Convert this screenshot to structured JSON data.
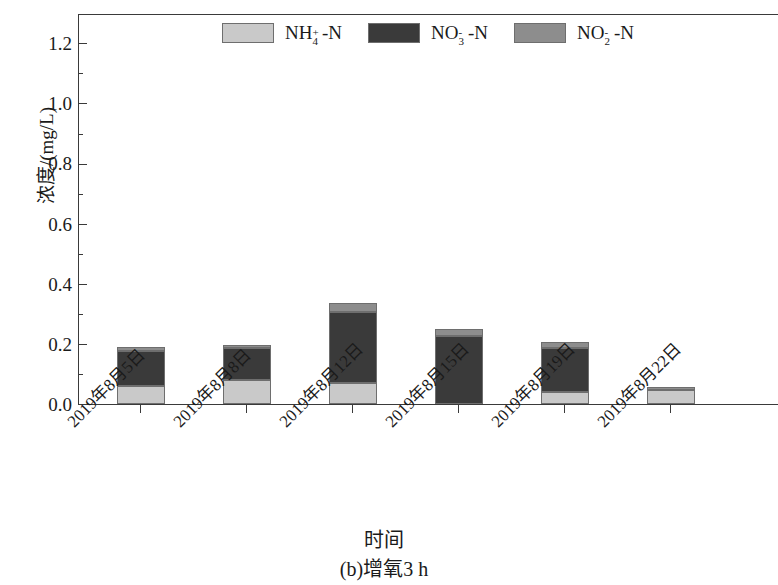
{
  "chart_data": {
    "type": "bar",
    "subtype": "stacked",
    "title": "",
    "caption": "(b)增氧3 h",
    "xlabel": "时间",
    "ylabel": "浓度/(mg/L)",
    "ylim": [
      0.0,
      1.3
    ],
    "ytick_labels": [
      "0.0",
      "0.2",
      "0.4",
      "0.6",
      "0.8",
      "1.0",
      "1.2"
    ],
    "ytick_values": [
      0.0,
      0.2,
      0.4,
      0.6,
      0.8,
      1.0,
      1.2
    ],
    "minor_ytick_values": [
      0.1,
      0.3,
      0.5,
      0.7,
      0.9,
      1.1,
      1.3
    ],
    "grid": false,
    "legend_position": "top-center",
    "categories": [
      "2019年8月5日",
      "2019年8月8日",
      "2019年8月12日",
      "2019年8月15日",
      "2019年8月19日",
      "2019年8月22日"
    ],
    "series": [
      {
        "name": "NH4+-N",
        "label_html": "NH<span class=\"stack\"><sup>+</sup><sub>4</sub></span>&nbsp;&nbsp;-N",
        "color": "#c9c9c9",
        "values": [
          0.06,
          0.08,
          0.07,
          0.0,
          0.04,
          0.045
        ]
      },
      {
        "name": "NO3--N",
        "label_html": "NO<span class=\"stack\"><sup>-</sup><sub>3</sub></span>&nbsp;&nbsp;-N",
        "color": "#3a3a3a",
        "values": [
          0.115,
          0.105,
          0.235,
          0.225,
          0.145,
          0.0
        ]
      },
      {
        "name": "NO2--N",
        "label_html": "NO<span class=\"stack\"><sup>-</sup><sub>2</sub></span>&nbsp;&nbsp;-N",
        "color": "#8d8d8d",
        "values": [
          0.015,
          0.01,
          0.03,
          0.025,
          0.02,
          0.01
        ]
      }
    ],
    "totals": [
      0.19,
      0.195,
      0.335,
      0.25,
      0.205,
      0.055
    ]
  },
  "legend": {
    "entries": [
      {
        "label": "NH4+-N",
        "color": "#c9c9c9"
      },
      {
        "label": "NO3--N",
        "color": "#3a3a3a"
      },
      {
        "label": "NO2--N",
        "color": "#8d8d8d"
      }
    ]
  },
  "axes": {
    "y_title": "浓度/(mg/L)",
    "x_title": "时间"
  },
  "caption": "(b)增氧3 h"
}
